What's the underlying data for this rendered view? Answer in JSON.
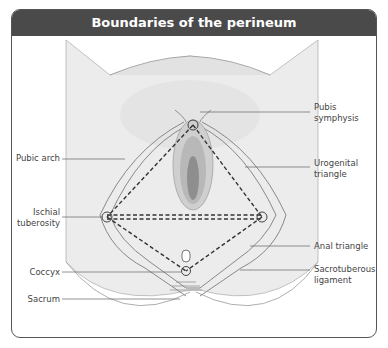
{
  "title": "Boundaries of the perineum",
  "labels_left": [
    {
      "id": "pubic-arch",
      "text": "Pubic arch"
    },
    {
      "id": "ischial-tuberosity",
      "line1": "Ischial",
      "line2": "tuberosity"
    },
    {
      "id": "coccyx",
      "text": "Coccyx"
    },
    {
      "id": "sacrum",
      "text": "Sacrum"
    }
  ],
  "labels_right": [
    {
      "id": "pubis-symphysis",
      "line1": "Pubis",
      "line2": "symphysis"
    },
    {
      "id": "urogenital-triangle",
      "line1": "Urogenital",
      "line2": "triangle"
    },
    {
      "id": "anal-triangle",
      "text": "Anal triangle"
    },
    {
      "id": "sacrotuberous-ligament",
      "line1": "Sacrotuberous",
      "line2": "ligament"
    }
  ],
  "colors": {
    "header_bg": "#4a4a4a",
    "skin": "#ececec",
    "line": "#777777",
    "dash": "#333333"
  }
}
